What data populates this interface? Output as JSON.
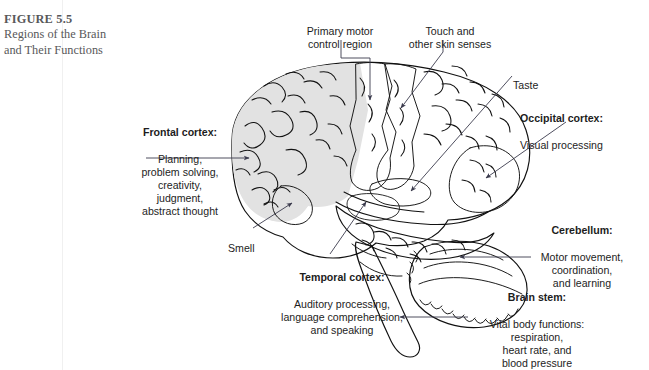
{
  "figure": {
    "number": "FIGURE 5.5",
    "title": "Regions of the\nBrain and Their\nFunctions",
    "title_color": "#58585a"
  },
  "diagram": {
    "colors": {
      "outline": "#111111",
      "cortex_light": "#e2e2e2",
      "cortex_white": "#fdfdfd",
      "motor_strip": "#8d8d8d",
      "somatosensory_strip": "#a8a8a8",
      "taste_region": "#9a9a9a",
      "occipital_region": "#c9c9c9",
      "smell_region": "#b4b4b4",
      "temporal_region": "#a0a0a0",
      "leader_line": "#3b3b4d"
    },
    "labels": [
      {
        "id": "primary-motor",
        "heading": "",
        "body": "Primary motor\ncontrol region",
        "align": "center",
        "leader": "vertical-down-to-motor-strip"
      },
      {
        "id": "touch",
        "heading": "",
        "body": "Touch and\nother skin senses",
        "align": "center",
        "leader": "diagonal-down-left-to-somatosensory-strip"
      },
      {
        "id": "taste",
        "heading": "",
        "body": "Taste",
        "align": "left",
        "leader": "diagonal-down-left-to-taste-region"
      },
      {
        "id": "occipital",
        "heading": "Occipital cortex:",
        "body": "Visual processing",
        "align": "left",
        "leader": "diagonal-down-left-to-occipital-lobe"
      },
      {
        "id": "frontal",
        "heading": "Frontal cortex:",
        "body": "Planning,\nproblem solving,\ncreativity,\njudgment,\nabstract thought",
        "align": "center",
        "leader": "horizontal-right-to-frontal-lobe"
      },
      {
        "id": "smell",
        "heading": "",
        "body": "Smell",
        "align": "left",
        "leader": "diagonal-up-right-to-olfactory-region"
      },
      {
        "id": "cerebellum",
        "heading": "Cerebellum:",
        "body": "Motor movement,\ncoordination,\nand learning",
        "align": "center",
        "leader": "horizontal-left-to-cerebellum"
      },
      {
        "id": "temporal",
        "heading": "Temporal cortex:",
        "body": "Auditory processing,\nlanguage comprehension,\nand speaking",
        "align": "center",
        "leader": "diagonal-up-right-to-temporal-lobe"
      },
      {
        "id": "brainstem",
        "heading": "Brain stem:",
        "body": "Vital body functions:\nrespiration,\nheart rate, and\nblood pressure",
        "align": "center",
        "leader": "horizontal-left-to-brain-stem"
      }
    ]
  }
}
